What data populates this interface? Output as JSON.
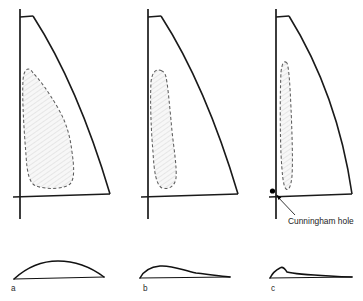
{
  "figure": {
    "caption_labels": [
      "a",
      "b",
      "c"
    ],
    "annotation": {
      "text": "Cunningham hole",
      "target": "tack-grommet"
    },
    "colors": {
      "outline": "#1a1a1a",
      "draft_stroke": "#5d5d5d",
      "draft_fill": "#f2f2f2",
      "grommet": "#000000",
      "background": "#ffffff",
      "label_text": "#2a2a2a"
    }
  },
  "panels": [
    {
      "id": "a",
      "label": "a",
      "label_x": 11,
      "label_y": 290,
      "mast": {
        "x": 20,
        "y_top": 9,
        "y_bottom": 219
      },
      "head": {
        "x1": 20,
        "y1": 17,
        "x2": 33,
        "y2": 16
      },
      "foot": {
        "x1": 13,
        "y1": 197,
        "x2": 110,
        "y2": 194
      },
      "leech_path": "M33,16 C60,58 88,120 110,194",
      "draft_path": "M33,73 C29,66 24,68 23,80 C22,100 24,130 26,155 C27,172 29,183 36,186 C48,190 64,189 70,184 C75,179 74,166 72,152 C70,135 66,122 58,108 C48,91 40,80 33,73 Z",
      "draft_label": "broad draft aft and low"
    },
    {
      "id": "b",
      "label": "b",
      "label_x": 143,
      "label_y": 290,
      "mast": {
        "x": 148,
        "y_top": 9,
        "y_bottom": 219
      },
      "head": {
        "x1": 148,
        "y1": 17,
        "x2": 161,
        "y2": 16
      },
      "foot": {
        "x1": 141,
        "y1": 197,
        "x2": 238,
        "y2": 194
      },
      "leech_path": "M161,16 C188,58 216,120 238,194",
      "draft_path": "M162,71 C156,68 152,72 151,82 C150,100 151,130 153,152 C154,171 156,185 162,188 C169,190 175,186 176,178 C177,167 174,150 172,131 C170,110 168,86 166,77 C165,73 164,72 162,71 Z",
      "draft_label": "narrow draft forward"
    },
    {
      "id": "c",
      "label": "c",
      "label_x": 271,
      "label_y": 290,
      "mast": {
        "x": 276,
        "y_top": 9,
        "y_bottom": 219
      },
      "head": {
        "x1": 276,
        "y1": 17,
        "x2": 289,
        "y2": 16
      },
      "foot": {
        "x1": 269,
        "y1": 197,
        "x2": 352,
        "y2": 194
      },
      "leech_path": "M289,16 C315,58 341,118 352,194",
      "draft_path": "M287,63 C284,60 282,63 281,72 C280,92 280,130 281,154 C282,172 283,186 286,189 C289,191 291,186 292,176 C293,160 292,132 291,108 C290,86 289,68 287,63 Z",
      "draft_label": "very narrow draft far forward",
      "grommet": {
        "x": 272.5,
        "y": 191,
        "r": 2.6
      },
      "leader": {
        "x1": 295,
        "y1": 215,
        "x2": 276,
        "y2": 195
      },
      "callout": {
        "text": "Cunningham hole",
        "x": 287,
        "y": 223
      }
    }
  ],
  "sections": [
    {
      "id": "a",
      "label": "a",
      "label_x": 11,
      "label_y": 290,
      "chord": {
        "x1": 14,
        "y1": 279,
        "x2": 104,
        "y2": 277
      },
      "camber_path": "M14,279 C26,268 42,261 58,261 C76,261 92,268 104,277",
      "max_camber_position_pct": 42,
      "description": "deep camber, draft near mid-chord"
    },
    {
      "id": "b",
      "label": "b",
      "label_x": 143,
      "label_y": 290,
      "chord": {
        "x1": 140,
        "y1": 278,
        "x2": 230,
        "y2": 277
      },
      "camber_path": "M140,278 C143,272 150,267 160,266 C172,265 182,270 196,273 C212,275 222,276 230,277",
      "max_camber_position_pct": 24,
      "description": "flatter camber, draft forward"
    },
    {
      "id": "c",
      "label": "c",
      "label_x": 271,
      "label_y": 290,
      "chord": {
        "x1": 270,
        "y1": 278,
        "x2": 352,
        "y2": 277
      },
      "camber_path": "M270,278 C272,274 276,270 280,268 C283,266 285,269 287,272 C294,274 310,275 330,276 C342,277 348,277 352,277",
      "max_camber_position_pct": 13,
      "description": "sharp hook, draft very far forward"
    }
  ]
}
